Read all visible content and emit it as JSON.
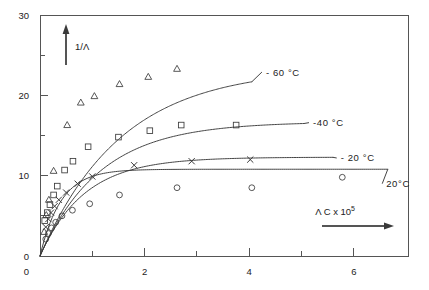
{
  "figure": {
    "background_color": "#ffffff",
    "line_color": "#3a3a3a",
    "axis_color": "#555555"
  },
  "axes": {
    "y_title": "1/Λ",
    "x_title_main": "Λ C x 10",
    "x_title_exponent": "5",
    "y_ticks": [
      "0",
      "10",
      "20",
      "30"
    ],
    "x_ticks": [
      "0",
      "2",
      "4",
      "6"
    ]
  },
  "chart_data": {
    "type": "scatter",
    "title": "",
    "xlabel": "Λ C x 10^5",
    "ylabel": "1/Λ",
    "xlim": [
      0,
      7.05
    ],
    "ylim": [
      0,
      30
    ],
    "x_major_ticks": [
      0,
      2,
      4,
      6
    ],
    "x_minor_ticks": [
      1,
      3,
      5
    ],
    "y_major_ticks": [
      0,
      10,
      20,
      30
    ],
    "y_minor_ticks": [
      5,
      15,
      25
    ],
    "grid": false,
    "legend_position": "inline-right-of-curves",
    "series": [
      {
        "name": "-60 °C",
        "label": "- 60 °C",
        "marker": "triangle",
        "label_x": 4.32,
        "label_y": 22.9,
        "curve_asymptote": 23.4,
        "curve_k": 1.55,
        "curve_x_end": 4.05,
        "points": [
          {
            "x": 0.08,
            "y": 3.0
          },
          {
            "x": 0.12,
            "y": 5.1
          },
          {
            "x": 0.17,
            "y": 7.0
          },
          {
            "x": 0.26,
            "y": 10.6
          },
          {
            "x": 0.52,
            "y": 16.3
          },
          {
            "x": 0.78,
            "y": 19.1
          },
          {
            "x": 1.04,
            "y": 19.9
          },
          {
            "x": 1.52,
            "y": 21.4
          },
          {
            "x": 2.07,
            "y": 22.3
          },
          {
            "x": 2.62,
            "y": 23.3
          }
        ]
      },
      {
        "name": "-40 °C",
        "label": "-40 °C",
        "marker": "square",
        "label_x": 5.22,
        "label_y": 16.6,
        "curve_asymptote": 16.7,
        "curve_k": 1.15,
        "curve_x_end": 5.05,
        "points": [
          {
            "x": 0.09,
            "y": 4.4
          },
          {
            "x": 0.14,
            "y": 5.4
          },
          {
            "x": 0.19,
            "y": 6.4
          },
          {
            "x": 0.26,
            "y": 7.6
          },
          {
            "x": 0.33,
            "y": 8.7
          },
          {
            "x": 0.47,
            "y": 10.7
          },
          {
            "x": 0.63,
            "y": 11.8
          },
          {
            "x": 0.92,
            "y": 13.6
          },
          {
            "x": 1.5,
            "y": 14.8
          },
          {
            "x": 2.1,
            "y": 15.6
          },
          {
            "x": 2.7,
            "y": 16.3
          },
          {
            "x": 3.75,
            "y": 16.3
          }
        ]
      },
      {
        "name": "-20 °C",
        "label": "- 20 °C",
        "marker": "cross",
        "label_x": 5.75,
        "label_y": 12.2,
        "curve_asymptote": 12.3,
        "curve_k": 0.85,
        "curve_x_end": 5.6,
        "points": [
          {
            "x": 0.11,
            "y": 3.6
          },
          {
            "x": 0.16,
            "y": 4.6
          },
          {
            "x": 0.21,
            "y": 5.4
          },
          {
            "x": 0.28,
            "y": 6.2
          },
          {
            "x": 0.36,
            "y": 7.0
          },
          {
            "x": 0.5,
            "y": 7.9
          },
          {
            "x": 0.72,
            "y": 9.0
          },
          {
            "x": 1.0,
            "y": 9.9
          },
          {
            "x": 1.8,
            "y": 11.3
          },
          {
            "x": 2.9,
            "y": 11.8
          },
          {
            "x": 4.02,
            "y": 12.0
          }
        ]
      },
      {
        "name": "20 °C",
        "label": "20°C",
        "marker": "circle",
        "label_x": 6.62,
        "label_y": 9.0,
        "curve_asymptote": 10.8,
        "curve_k": 0.4,
        "curve_x_end": 6.65,
        "points": [
          {
            "x": 0.11,
            "y": 2.1
          },
          {
            "x": 0.16,
            "y": 2.8
          },
          {
            "x": 0.22,
            "y": 3.5
          },
          {
            "x": 0.3,
            "y": 4.2
          },
          {
            "x": 0.42,
            "y": 5.0
          },
          {
            "x": 0.62,
            "y": 5.7
          },
          {
            "x": 0.95,
            "y": 6.5
          },
          {
            "x": 1.52,
            "y": 7.6
          },
          {
            "x": 2.62,
            "y": 8.5
          },
          {
            "x": 4.05,
            "y": 8.5
          },
          {
            "x": 5.78,
            "y": 9.8
          }
        ]
      }
    ]
  }
}
